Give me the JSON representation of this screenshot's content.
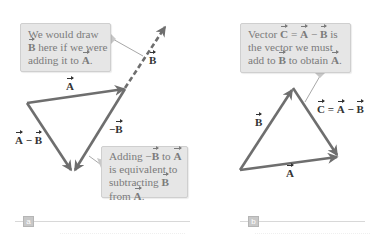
{
  "figure": {
    "colors": {
      "arrow": "#6e6e6e",
      "callout_bg": "#e6e6e6",
      "callout_text": "#7b7b7b",
      "leader_line": "#a8a8a8",
      "label_text": "#333333",
      "tag_bg": "#c8c8c8"
    },
    "panel_a": {
      "tag": "a",
      "callout_top": {
        "line1": "We would draw",
        "line2_vec": "B",
        "line2_rest": " here if we were",
        "line3_pre": "adding it to ",
        "line3_vec": "A",
        "line3_post": "."
      },
      "callout_bottom": {
        "line1_pre": "Adding −",
        "line1_vec1": "B",
        "line1_mid": " to ",
        "line1_vec2": "A",
        "line2": "is equivalent to",
        "line3_pre": "subtracting ",
        "line3_vec": "B",
        "line4_pre": "from ",
        "line4_vec": "A",
        "line4_post": "."
      },
      "labels": {
        "A": "A",
        "B": "B",
        "negB_sign": "−",
        "negB_vec": "B",
        "diff_vec1": "A",
        "diff_op": " − ",
        "diff_vec2": "B"
      }
    },
    "panel_b": {
      "tag": "b",
      "callout": {
        "line1_pre": "Vector ",
        "line1_vec1": "C",
        "line1_eq": " = ",
        "line1_vec2": "A",
        "line1_op": " − ",
        "line1_vec3": "B",
        "line1_post": " is",
        "line2": "the vector we must",
        "line3_pre": "add to ",
        "line3_vec1": "B",
        "line3_mid": " to obtain ",
        "line3_vec2": "A",
        "line3_post": "."
      },
      "labels": {
        "A": "A",
        "B": "B",
        "C_vec1": "C",
        "C_eq": " = ",
        "C_vec2": "A",
        "C_op": " − ",
        "C_vec3": "B"
      }
    }
  }
}
